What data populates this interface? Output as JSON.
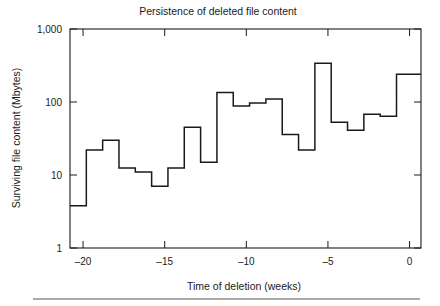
{
  "chart_data": {
    "type": "line",
    "subtype": "step-post",
    "title": "Persistence of deleted file content",
    "xlabel": "Time of deletion (weeks)",
    "ylabel": "Surviving file content (Mbytes)",
    "xlim": [
      -20.8,
      0.7
    ],
    "ylim": [
      1,
      1000
    ],
    "yscale": "log",
    "xscale": "linear",
    "grid": false,
    "legend": null,
    "xticks": [
      -20,
      -15,
      -10,
      -5,
      0
    ],
    "xticklabels": [
      "–20",
      "–15",
      "–10",
      "–5",
      "0"
    ],
    "yticks": [
      1,
      10,
      100,
      1000
    ],
    "yticklabels": [
      "1",
      "10",
      "100",
      "1,000"
    ],
    "series": [
      {
        "name": "Surviving file content",
        "color": "#1a1a1a",
        "x": [
          -20.8,
          -19.8,
          -18.8,
          -17.8,
          -16.8,
          -15.8,
          -14.8,
          -13.8,
          -12.8,
          -11.8,
          -10.8,
          -9.8,
          -8.8,
          -7.8,
          -6.8,
          -5.8,
          -4.8,
          -3.8,
          -2.8,
          -1.8,
          -0.8,
          0.7
        ],
        "values": [
          3.8,
          22,
          30,
          12.5,
          11,
          7,
          12.5,
          45,
          15,
          135,
          88,
          97,
          110,
          36,
          22,
          340,
          53,
          41,
          68,
          64,
          240,
          240
        ]
      }
    ]
  },
  "footer": {
    "rule": true
  }
}
